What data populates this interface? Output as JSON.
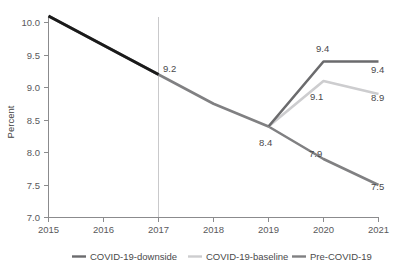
{
  "chart_data": {
    "type": "line",
    "title": "",
    "subtitle": "",
    "xlabel": "",
    "ylabel": "Percent",
    "x": [
      2015,
      2016,
      2017,
      2018,
      2019,
      2020,
      2021
    ],
    "xlim": [
      2015,
      2021
    ],
    "ylim": [
      7.0,
      10.0
    ],
    "x_ticks": [
      "2015",
      "2016",
      "2017",
      "2018",
      "2019",
      "2020",
      "2021"
    ],
    "y_ticks": [
      "7.0",
      "7.5",
      "8.0",
      "8.5",
      "9.0",
      "9.5",
      "10.0"
    ],
    "grid": false,
    "legend_position": "bottom",
    "reference_line_x": 2017,
    "series": [
      {
        "name": "Pre-COVID-19",
        "color": "#808082",
        "x": [
          2015,
          2016,
          2017,
          2018,
          2019,
          2020,
          2021
        ],
        "values": [
          10.1,
          9.65,
          9.2,
          8.75,
          8.4,
          7.9,
          7.5
        ]
      },
      {
        "name": "COVID-19-baseline",
        "color": "#cdcdcf",
        "x": [
          2019,
          2020,
          2021
        ],
        "values": [
          8.4,
          9.1,
          8.9
        ]
      },
      {
        "name": "COVID-19-downside",
        "color": "#6b6b6d",
        "x": [
          2019,
          2020,
          2021
        ],
        "values": [
          8.4,
          9.4,
          9.4
        ]
      },
      {
        "name": "history",
        "color": "#1a1a1a",
        "x": [
          2015,
          2016,
          2017
        ],
        "values": [
          10.1,
          9.65,
          9.2
        ]
      }
    ],
    "annotations": [
      {
        "id": "label-2017",
        "text": "9.2",
        "x": 2017,
        "y": 9.2
      },
      {
        "id": "label-2019",
        "text": "8.4",
        "x": 2019,
        "y": 8.4
      },
      {
        "id": "label-downside-2020",
        "text": "9.4",
        "x": 2020,
        "y": 9.4
      },
      {
        "id": "label-downside-2021",
        "text": "9.4",
        "x": 2021,
        "y": 9.4
      },
      {
        "id": "label-baseline-2020",
        "text": "9.1",
        "x": 2020,
        "y": 9.1
      },
      {
        "id": "label-baseline-2021",
        "text": "8.9",
        "x": 2021,
        "y": 8.9
      },
      {
        "id": "label-pre-2020",
        "text": "7.9",
        "x": 2020,
        "y": 7.9
      },
      {
        "id": "label-pre-2021",
        "text": "7.5",
        "x": 2021,
        "y": 7.5
      }
    ]
  },
  "legend": {
    "items": [
      {
        "label": "COVID-19-downside",
        "color": "#6b6b6d"
      },
      {
        "label": "COVID-19-baseline",
        "color": "#cdcdcf"
      },
      {
        "label": "Pre-COVID-19",
        "color": "#808082"
      }
    ]
  },
  "axis": {
    "y_title": "Percent",
    "y_tick_labels": [
      "10.0",
      "9.5",
      "9.0",
      "8.5",
      "8.0",
      "7.5",
      "7.0"
    ],
    "x_tick_labels": [
      "2015",
      "2016",
      "2017",
      "2018",
      "2019",
      "2020",
      "2021"
    ]
  },
  "colors": {
    "history": "#1a1a1a",
    "pre_covid": "#808082",
    "baseline": "#cdcdcf",
    "downside": "#6b6b6d",
    "axis": "#8b8b8d",
    "reference": "#c9c9cb",
    "text": "#4a4a4c",
    "background": "#ffffff"
  }
}
